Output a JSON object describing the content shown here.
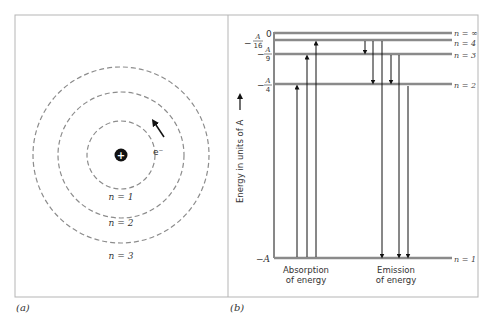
{
  "panel_a": {
    "label": "(a)",
    "electron_label": "e⁻",
    "nucleus_symbol": "+",
    "orbits": [
      {
        "label": "n = 1",
        "radius": 34
      },
      {
        "label": "n = 2",
        "radius": 63
      },
      {
        "label": "n = 3",
        "radius": 88
      }
    ]
  },
  "panel_b": {
    "label": "(b)",
    "axis_label": "Energy in units of A",
    "levels": [
      {
        "n_label": "n = ∞",
        "energy_label": "0",
        "y": 33
      },
      {
        "n_label": "n = 4",
        "energy_label": "−A/16",
        "y": 40
      },
      {
        "n_label": "n = 3",
        "energy_label": "−A/9",
        "y": 54
      },
      {
        "n_label": "n = 2",
        "energy_label": "−A/4",
        "y": 84
      },
      {
        "n_label": "n = 1",
        "energy_label": "−A",
        "y": 258
      }
    ],
    "energy_ticks": {
      "zero": "0",
      "a16_num": "A",
      "a16_den": "16",
      "a9_num": "A",
      "a9_den": "9",
      "a4_num": "A",
      "a4_den": "4",
      "a1": "−A",
      "minus": "−"
    },
    "n_labels": {
      "inf": "n = ∞",
      "n4": "n = 4",
      "n3": "n = 3",
      "n2": "n = 2",
      "n1": "n = 1"
    },
    "absorption_label_1": "Absorption",
    "absorption_label_2": "of energy",
    "emission_label_1": "Emission",
    "emission_label_2": "of energy",
    "absorption_transitions": [
      {
        "from": "n=1",
        "to": "n=2"
      },
      {
        "from": "n=1",
        "to": "n=3"
      },
      {
        "from": "n=1",
        "to": "n=4"
      }
    ],
    "emission_transitions": [
      {
        "from": "n=4",
        "to": "n=3"
      },
      {
        "from": "n=4",
        "to": "n=2"
      },
      {
        "from": "n=∞",
        "to": "n=1"
      },
      {
        "from": "n=3",
        "to": "n=2"
      },
      {
        "from": "n=3",
        "to": "n=1"
      },
      {
        "from": "n=2",
        "to": "n=1"
      }
    ]
  },
  "colors": {
    "level_line": "#8a8a8a",
    "frame": "#b5b5b5",
    "orbit": "#8c8c8c",
    "ink": "#111111"
  }
}
